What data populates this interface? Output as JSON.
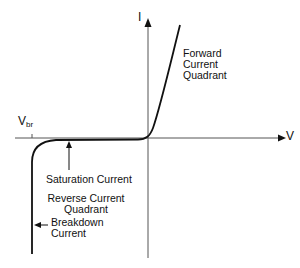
{
  "diagram": {
    "axes": {
      "x_label": "V",
      "y_label": "I"
    },
    "breakdown_voltage": {
      "main": "V",
      "sub": "br"
    },
    "annotations": {
      "forward": [
        "Forward",
        "Current",
        "Quadrant"
      ],
      "saturation": "Saturation Current",
      "reverse": [
        "Reverse Current",
        "Quadrant"
      ],
      "breakdown": [
        "Breakdown",
        "Current"
      ]
    },
    "colors": {
      "line": "#111111",
      "axis": "#555555",
      "background": "#ffffff"
    }
  }
}
